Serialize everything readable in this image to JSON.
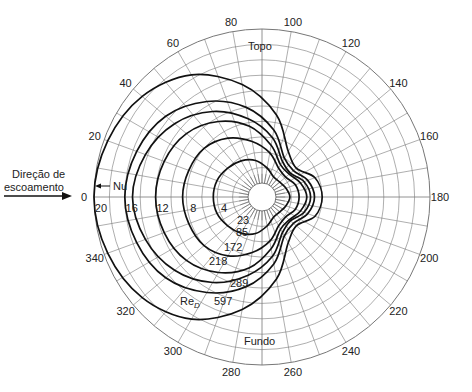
{
  "chart_data": {
    "type": "polar-line",
    "title": "",
    "angle_unit": "degrees",
    "angle_ticks": [
      0,
      20,
      40,
      60,
      80,
      100,
      120,
      140,
      160,
      180,
      200,
      220,
      240,
      260,
      280,
      300,
      320,
      340
    ],
    "radial_label": "Nu",
    "radial_ticks": [
      4,
      8,
      12,
      16,
      20
    ],
    "radial_range": [
      0,
      20
    ],
    "grid": true,
    "annotations": {
      "flow_direction": "Direção de escoamento",
      "top": "Topo",
      "bottom": "Fundo",
      "nu_marker": "Nu",
      "re_prefix": "Re",
      "re_subscript": "D"
    },
    "angles": [
      0,
      20,
      40,
      60,
      80,
      100,
      120,
      140,
      160,
      180
    ],
    "symmetric_about_0_180": true,
    "series": [
      {
        "name": "597",
        "values": [
          20,
          19.5,
          18.5,
          16.5,
          13,
          9,
          5,
          4,
          5.5,
          6
        ]
      },
      {
        "name": "289",
        "values": [
          16,
          15.5,
          14.5,
          12.5,
          10,
          7,
          4,
          3.5,
          4.5,
          5
        ]
      },
      {
        "name": "218",
        "values": [
          15,
          14.3,
          13,
          11,
          8.5,
          6,
          3.5,
          3,
          4,
          4.5
        ]
      },
      {
        "name": "172",
        "values": [
          12,
          11.7,
          11,
          9.5,
          7.5,
          5,
          3,
          2.8,
          3.5,
          4
        ]
      },
      {
        "name": "85",
        "values": [
          8.5,
          8.3,
          8,
          7,
          5.5,
          4,
          2.5,
          2.2,
          2.8,
          3
        ]
      },
      {
        "name": "23",
        "values": [
          4.5,
          4.4,
          4,
          3.6,
          3,
          2,
          1.2,
          1.2,
          1.5,
          1.8
        ]
      }
    ]
  },
  "labels": {
    "flow_line1": "Direção de",
    "flow_line2": "escoamento",
    "top": "Topo",
    "bottom": "Fundo",
    "nu": "Nu",
    "re": "Re",
    "re_sub": "D"
  }
}
